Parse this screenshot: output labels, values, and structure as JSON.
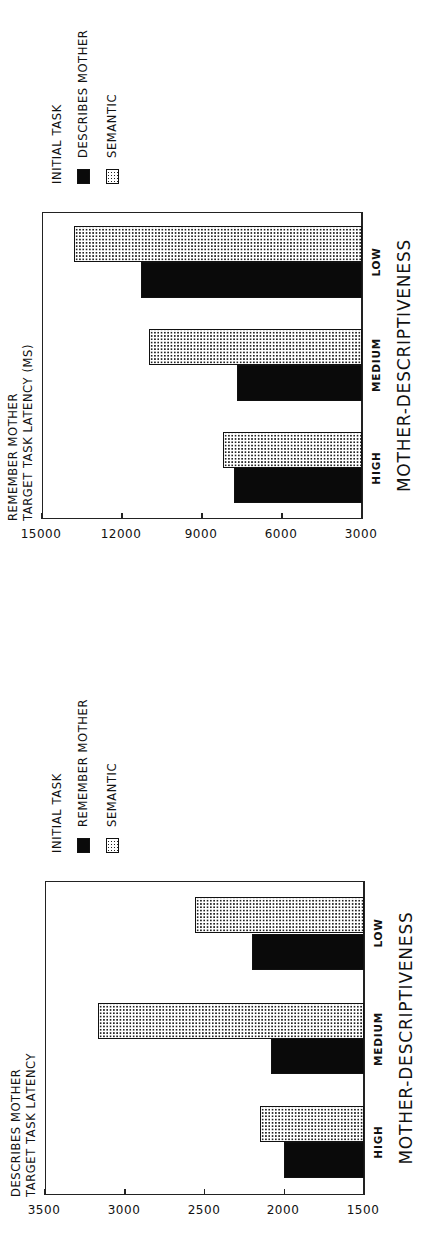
{
  "chart_data": [
    {
      "type": "bar",
      "title": "",
      "ylabel": "REMEMBER MOTHER TARGET TASK LATENCY (MS)",
      "ylabel_lines": [
        "REMEMBER MOTHER",
        "TARGET TASK LATENCY (MS)"
      ],
      "xlabel": "MOTHER-DESCRIPTIVENESS",
      "categories": [
        "HIGH",
        "MEDIUM",
        "LOW"
      ],
      "ylim": [
        3000,
        15000
      ],
      "yticks": [
        3000,
        6000,
        9000,
        12000,
        15000
      ],
      "legend_title": "INITIAL TASK",
      "legend_position": "right",
      "grid": false,
      "series": [
        {
          "name": "DESCRIBES MOTHER",
          "fill": "solid",
          "values": [
            7800,
            7700,
            11300
          ]
        },
        {
          "name": "SEMANTIC",
          "fill": "dotted",
          "values": [
            8200,
            11000,
            13800
          ]
        }
      ]
    },
    {
      "type": "bar",
      "title": "",
      "ylabel": "DESCRIBES MOTHER TARGET TASK LATENCY",
      "ylabel_lines": [
        "DESCRIBES MOTHER",
        "TARGET TASK LATENCY"
      ],
      "xlabel": "MOTHER-DESCRIPTIVENESS",
      "categories": [
        "HIGH",
        "MEDIUM",
        "LOW"
      ],
      "ylim": [
        1500,
        3500
      ],
      "yticks": [
        1500,
        2000,
        2500,
        3000,
        3500
      ],
      "legend_title": "INITIAL TASK",
      "legend_position": "right",
      "grid": false,
      "series": [
        {
          "name": "REMEMBER MOTHER",
          "fill": "solid",
          "values": [
            2000,
            2080,
            2200
          ]
        },
        {
          "name": "SEMANTIC",
          "fill": "dotted",
          "values": [
            2150,
            3170,
            2560
          ]
        }
      ]
    }
  ],
  "colors": {
    "solid_bar": "#0a0a0a",
    "dotted_bar_dots": "#222222",
    "background": "#ffffff"
  },
  "layout": {
    "orientation": "rotated-90-ccw",
    "charts": [
      {
        "frame": {
          "left": 41,
          "width": 307,
          "top": 42,
          "height": 320
        },
        "bar_u": [
          [
            57,
            92
          ],
          [
            159,
            195
          ],
          [
            262,
            298
          ]
        ],
        "bar_w": 36
      },
      {
        "frame": {
          "left": 64,
          "width": 314,
          "top": 45,
          "height": 319
        },
        "bar_u": [
          [
            81,
            117
          ],
          [
            185,
            220
          ],
          [
            289,
            326
          ]
        ],
        "bar_w": 36
      }
    ]
  }
}
